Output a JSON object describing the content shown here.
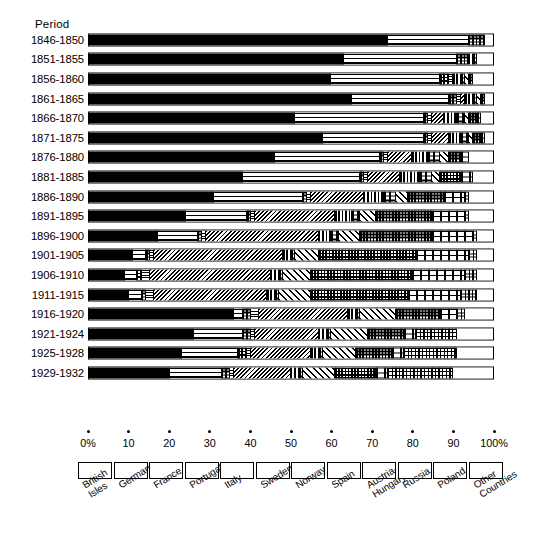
{
  "header": {
    "period_label": "Period"
  },
  "axis": {
    "ticks": [
      {
        "value": 0,
        "label": "0%"
      },
      {
        "value": 10,
        "label": "10"
      },
      {
        "value": 20,
        "label": "20"
      },
      {
        "value": 30,
        "label": "30"
      },
      {
        "value": 40,
        "label": "40"
      },
      {
        "value": 50,
        "label": "50"
      },
      {
        "value": 60,
        "label": "60"
      },
      {
        "value": 70,
        "label": "70"
      },
      {
        "value": 80,
        "label": "80"
      },
      {
        "value": 90,
        "label": "90"
      },
      {
        "value": 100,
        "label": "100%"
      }
    ]
  },
  "legend": {
    "items": [
      {
        "label": "British Isles",
        "lines": [
          "British",
          "Isles"
        ],
        "pattern": "solid-black"
      },
      {
        "label": "Germany",
        "lines": [
          "Germany"
        ],
        "pattern": "horizontal-lines"
      },
      {
        "label": "France",
        "lines": [
          "France"
        ],
        "pattern": "coarse-grid"
      },
      {
        "label": "Portugal",
        "lines": [
          "Portugal"
        ],
        "pattern": "fine-horizontal-lines"
      },
      {
        "label": "Italy",
        "lines": [
          "Italy"
        ],
        "pattern": "back-diagonal-hatch"
      },
      {
        "label": "Sweden",
        "lines": [
          "Sweden"
        ],
        "pattern": "vertical-lines"
      },
      {
        "label": "Norway",
        "lines": [
          "Norway"
        ],
        "pattern": "brick-dots"
      },
      {
        "label": "Spain",
        "lines": [
          "Spain"
        ],
        "pattern": "forward-diagonal-hatch"
      },
      {
        "label": "Austria-Hungary",
        "lines": [
          "Austria-",
          "Hungary"
        ],
        "pattern": "dense-grid"
      },
      {
        "label": "Russia",
        "lines": [
          "Russia"
        ],
        "pattern": "dashed-rows"
      },
      {
        "label": "Poland",
        "lines": [
          "Poland"
        ],
        "pattern": "dotted-grid"
      },
      {
        "label": "Other Countries",
        "lines": [
          "Other",
          "Countries"
        ],
        "pattern": "white"
      }
    ]
  },
  "chart_data": {
    "type": "bar",
    "orientation": "horizontal",
    "stacked": true,
    "normalized_percent": true,
    "title": "",
    "xlabel": "",
    "ylabel": "Period",
    "xlim": [
      0,
      100
    ],
    "grid": false,
    "legend_position": "bottom",
    "categories": [
      "1846-1850",
      "1851-1855",
      "1856-1860",
      "1861-1865",
      "1866-1870",
      "1871-1875",
      "1876-1880",
      "1881-1885",
      "1886-1890",
      "1891-1895",
      "1896-1900",
      "1901-1905",
      "1906-1910",
      "1911-1915",
      "1916-1920",
      "1921-1924",
      "1925-1928",
      "1929-1932"
    ],
    "series": [
      {
        "name": "British Isles",
        "values": [
          74,
          63,
          60,
          65,
          51,
          58,
          46,
          38,
          31,
          24,
          17,
          11,
          9,
          10,
          36,
          26,
          23,
          20
        ]
      },
      {
        "name": "Germany",
        "values": [
          20,
          28,
          27,
          24,
          32,
          25,
          26,
          29,
          22,
          15,
          10,
          3,
          3,
          3,
          2,
          12,
          14,
          13
        ]
      },
      {
        "name": "France",
        "values": [
          4,
          3,
          2,
          2,
          1,
          1,
          1,
          1,
          1,
          1,
          1,
          1,
          1,
          1,
          2,
          2,
          2,
          2
        ]
      },
      {
        "name": "Portugal",
        "values": [
          0,
          0,
          1,
          1,
          1,
          1,
          1,
          1,
          1,
          1,
          1,
          1,
          2,
          2,
          2,
          1,
          1,
          1
        ]
      },
      {
        "name": "Italy",
        "values": [
          0,
          0,
          0,
          1,
          3,
          4,
          6,
          8,
          13,
          20,
          28,
          32,
          30,
          28,
          22,
          16,
          15,
          14
        ]
      },
      {
        "name": "Sweden",
        "values": [
          0,
          1,
          2,
          2,
          3,
          3,
          4,
          5,
          5,
          4,
          3,
          2,
          2,
          2,
          2,
          2,
          2,
          2
        ]
      },
      {
        "name": "Norway",
        "values": [
          0,
          1,
          1,
          1,
          2,
          2,
          3,
          3,
          3,
          2,
          2,
          1,
          1,
          1,
          1,
          1,
          1,
          1
        ]
      },
      {
        "name": "Spain",
        "values": [
          0,
          0,
          1,
          1,
          1,
          1,
          2,
          2,
          3,
          4,
          5,
          6,
          7,
          8,
          9,
          9,
          8,
          8
        ]
      },
      {
        "name": "Austria-Hungary",
        "values": [
          0,
          0,
          1,
          1,
          2,
          2,
          3,
          5,
          9,
          14,
          18,
          24,
          25,
          24,
          11,
          9,
          9,
          10
        ]
      },
      {
        "name": "Russia",
        "values": [
          0,
          0,
          0,
          0,
          1,
          1,
          2,
          3,
          5,
          8,
          10,
          13,
          13,
          13,
          4,
          3,
          3,
          3
        ]
      },
      {
        "name": "Poland",
        "values": [
          0,
          0,
          0,
          0,
          0,
          0,
          0,
          0,
          1,
          1,
          1,
          2,
          3,
          4,
          2,
          10,
          13,
          16
        ]
      },
      {
        "name": "Other Countries",
        "values": [
          2,
          4,
          5,
          2,
          3,
          2,
          6,
          5,
          6,
          6,
          4,
          4,
          4,
          4,
          7,
          9,
          9,
          10
        ]
      }
    ]
  }
}
